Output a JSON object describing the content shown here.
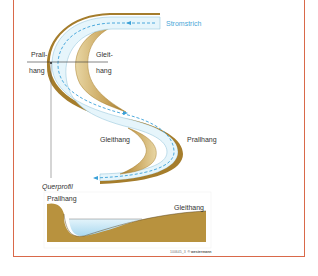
{
  "figure": {
    "frame_color": "#d9694a",
    "colors": {
      "river_water": "#e6f5fb",
      "river_outline": "#9cc9de",
      "current_line": "#3aa0d8",
      "bank_dark": "#a87f2e",
      "bank_light": "#e4cf9a",
      "soil": "#b8923e",
      "water_deep": "#bde3f3",
      "label_text": "#333333",
      "current_label": "#4aa8d8"
    },
    "labels": {
      "current": "Stromstrich",
      "upper_cut_bank_1": "Prall-",
      "upper_cut_bank_2": "hang",
      "upper_slip_off_1": "Gleit-",
      "upper_slip_off_2": "hang",
      "lower_slip_off": "Gleithang",
      "lower_cut_bank": "Prallhang",
      "cross_section_title": "Querprofil",
      "cross_section_cut_bank": "Prallhang",
      "cross_section_slip_off": "Gleithang"
    },
    "caption": {
      "id": "100645_3",
      "copyright": "© westermann"
    }
  }
}
